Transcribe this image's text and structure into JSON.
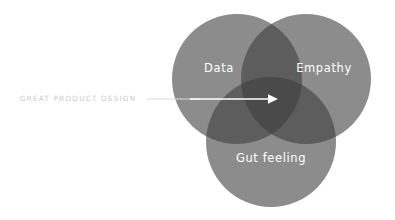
{
  "diagram": {
    "type": "venn-3-circle",
    "background_color": "#ffffff",
    "title_label": "GREAT PRODUCT DESIGN",
    "sets": [
      {
        "id": "data",
        "label": "Data",
        "cx": 237,
        "cy": 79,
        "r": 65,
        "fill": "#8c8c8c",
        "label_x": 219,
        "label_y": 68
      },
      {
        "id": "empathy",
        "label": "Empathy",
        "cx": 306,
        "cy": 79,
        "r": 65,
        "fill": "#8c8c8c",
        "label_x": 324,
        "label_y": 68
      },
      {
        "id": "gut-feeling",
        "label": "Gut feeling",
        "cx": 271,
        "cy": 142,
        "r": 65,
        "fill": "#8c8c8c",
        "label_x": 271,
        "label_y": 158
      }
    ],
    "overlap_pair_color": "#5d5d5d",
    "overlap_triple_color": "#4a4a4a",
    "callout": {
      "label": "GREAT PRODUCT DESIGN",
      "text_color": "#c9c9c9",
      "text_x": 20,
      "text_y": 99,
      "line_color_outer": "#d9d9d9",
      "line_color_inner": "#ffffff",
      "line_start_x": 147,
      "line_end_x": 276,
      "line_y": 99,
      "arrow_tip_x": 278,
      "arrow_size": 6
    }
  }
}
